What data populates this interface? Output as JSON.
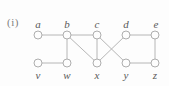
{
  "figure_label": "(i)",
  "colors": {
    "background": "#fdfdfd",
    "edge": "#b6b6b6",
    "vertex_stroke": "#aeaeae",
    "vertex_fill": "#fdfdfd",
    "vertex_label": "#5a5a5a",
    "figure_label_color": "#7d7d7d"
  },
  "graph": {
    "vertex_radius": 4,
    "edge_stroke_width": 1,
    "vertices": [
      {
        "id": "a",
        "label": "a",
        "x": 38,
        "y": 35,
        "label_x": 38,
        "label_y": 28
      },
      {
        "id": "b",
        "label": "b",
        "x": 67,
        "y": 35,
        "label_x": 67,
        "label_y": 28
      },
      {
        "id": "c",
        "label": "c",
        "x": 97,
        "y": 35,
        "label_x": 97,
        "label_y": 28
      },
      {
        "id": "d",
        "label": "d",
        "x": 126,
        "y": 35,
        "label_x": 126,
        "label_y": 28
      },
      {
        "id": "e",
        "label": "e",
        "x": 155,
        "y": 35,
        "label_x": 156,
        "label_y": 28
      },
      {
        "id": "v",
        "label": "v",
        "x": 38,
        "y": 63,
        "label_x": 38,
        "label_y": 79
      },
      {
        "id": "w",
        "label": "w",
        "x": 67,
        "y": 63,
        "label_x": 67,
        "label_y": 79
      },
      {
        "id": "x",
        "label": "x",
        "x": 97,
        "y": 63,
        "label_x": 97,
        "label_y": 79
      },
      {
        "id": "y",
        "label": "y",
        "x": 126,
        "y": 63,
        "label_x": 126,
        "label_y": 79
      },
      {
        "id": "z",
        "label": "z",
        "x": 155,
        "y": 63,
        "label_x": 155,
        "label_y": 79
      }
    ],
    "edges": [
      [
        "a",
        "b"
      ],
      [
        "b",
        "c"
      ],
      [
        "d",
        "e"
      ],
      [
        "v",
        "w"
      ],
      [
        "y",
        "z"
      ],
      [
        "b",
        "w"
      ],
      [
        "c",
        "x"
      ],
      [
        "e",
        "z"
      ],
      [
        "b",
        "x"
      ],
      [
        "c",
        "y"
      ],
      [
        "d",
        "x"
      ]
    ]
  }
}
